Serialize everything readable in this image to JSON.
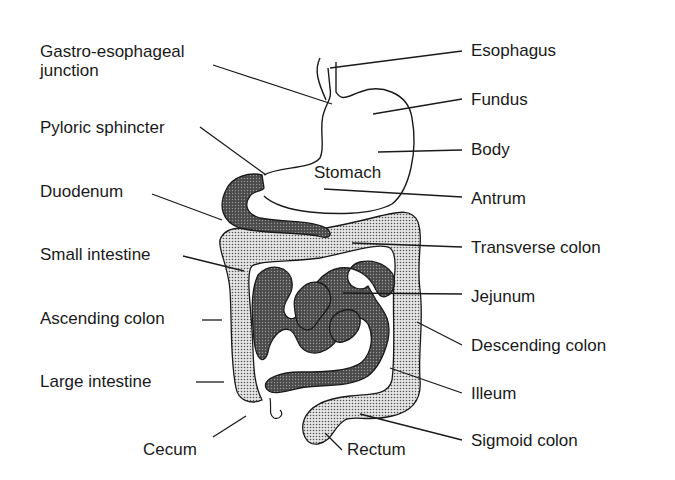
{
  "diagram": {
    "organ_label": "Stomach",
    "labels_left": [
      {
        "id": "gastro-esophageal-junction",
        "line1": "Gastro-esophageal",
        "line2": "junction"
      },
      {
        "id": "pyloric-sphincter",
        "text": "Pyloric sphincter"
      },
      {
        "id": "duodenum",
        "text": "Duodenum"
      },
      {
        "id": "small-intestine",
        "text": "Small intestine"
      },
      {
        "id": "ascending-colon",
        "text": "Ascending colon"
      },
      {
        "id": "large-intestine",
        "text": "Large intestine"
      },
      {
        "id": "cecum",
        "text": "Cecum"
      }
    ],
    "labels_right": [
      {
        "id": "esophagus",
        "text": "Esophagus"
      },
      {
        "id": "fundus",
        "text": "Fundus"
      },
      {
        "id": "body",
        "text": "Body"
      },
      {
        "id": "antrum",
        "text": "Antrum"
      },
      {
        "id": "transverse-colon",
        "text": "Transverse colon"
      },
      {
        "id": "jejunum",
        "text": "Jejunum"
      },
      {
        "id": "descending-colon",
        "text": "Descending colon"
      },
      {
        "id": "illeum",
        "text": "Illeum"
      },
      {
        "id": "sigmoid-colon",
        "text": "Sigmoid colon"
      },
      {
        "id": "rectum",
        "text": "Rectum"
      }
    ],
    "colors": {
      "line": "#1a1a1a",
      "small_intestine_fill": "#5a5a5a",
      "large_intestine_fill": "#c4c4c4",
      "background": "#ffffff"
    }
  }
}
